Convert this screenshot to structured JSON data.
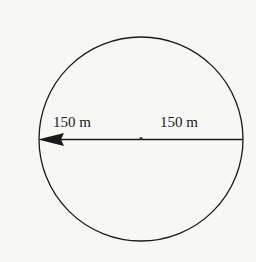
{
  "diagram": {
    "shape": "circle",
    "labels": {
      "left_radius": "150 m",
      "right_radius": "150 m"
    },
    "colors": {
      "background": "#f7f7f5",
      "stroke": "#1a1a1a"
    }
  }
}
